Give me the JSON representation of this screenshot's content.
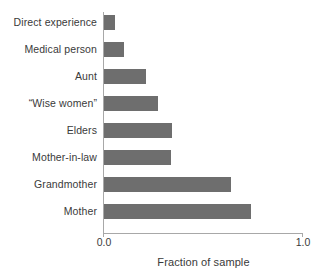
{
  "chart_data": {
    "type": "bar",
    "orientation": "horizontal",
    "title": "",
    "xlabel": "Fraction of sample",
    "ylabel": "",
    "xlim": [
      0.0,
      1.0
    ],
    "xticks": [
      "0.0",
      "1.0"
    ],
    "xtick_values": [
      0.0,
      1.0
    ],
    "grid": false,
    "legend": null,
    "bar_color": "#6e6e6e",
    "axis_color": "#a8a8a8",
    "text_color": "#3a3a3a",
    "categories": [
      "Direct experience",
      "Medical person",
      "Aunt",
      "“Wise women”",
      "Elders",
      "Mother-in-law",
      "Grandmother",
      "Mother"
    ],
    "values": [
      0.055,
      0.1,
      0.21,
      0.27,
      0.34,
      0.335,
      0.64,
      0.74
    ]
  }
}
